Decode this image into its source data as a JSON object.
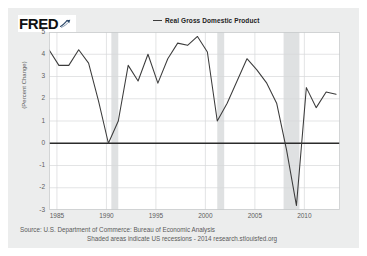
{
  "brand": {
    "name": "FRED",
    "mark_icon": "fred-swoosh-icon"
  },
  "legend": {
    "entries": [
      {
        "label": "Real Gross Domestic Product",
        "color": "#3b3b3b"
      }
    ]
  },
  "footer": {
    "source_line": "Source: U.S. Department of Commerce: Bureau of Economic Analysis",
    "note_line": "Shaded areas indicate US recessions - 2014 research.stlouisfed.org"
  },
  "colors": {
    "card_background": "#eceded",
    "plot_background": "#ffffff",
    "line": "#3b3b3b",
    "zero_line": "#2b2b2b",
    "gridline": "#d7d9da",
    "recession_band": "#dfe1e2",
    "tick_text": "#5d5d5d"
  },
  "chart_data": {
    "type": "line",
    "title": "Real Gross Domestic Product",
    "xlabel": "",
    "ylabel": "(Percent Change)",
    "xlim": [
      1984.2,
      2013.6
    ],
    "ylim": [
      -3,
      5
    ],
    "yticks": [
      5,
      4,
      3,
      2,
      1,
      0,
      -1,
      -2,
      -3
    ],
    "xticks": [
      1985,
      1990,
      1995,
      2000,
      2005,
      2010
    ],
    "grid": true,
    "legend_position": "top-center",
    "zero_line": 0,
    "series": [
      {
        "name": "Real Gross Domestic Product",
        "color": "#3b3b3b",
        "x": [
          1984.2,
          1985.2,
          1986.2,
          1987.2,
          1988.2,
          1989.2,
          1990.2,
          1991.2,
          1992.2,
          1993.2,
          1994.2,
          1995.2,
          1996.2,
          1997.2,
          1998.2,
          1999.2,
          2000.2,
          2001.2,
          2002.2,
          2003.2,
          2004.2,
          2005.2,
          2006.2,
          2007.2,
          2008.2,
          2009.2,
          2010.2,
          2011.2,
          2012.2,
          2013.2
        ],
        "y": [
          4.2,
          3.5,
          3.5,
          4.2,
          3.6,
          1.9,
          0.0,
          1.0,
          3.5,
          2.8,
          4.0,
          2.7,
          3.8,
          4.5,
          4.4,
          4.8,
          4.1,
          1.0,
          1.8,
          2.8,
          3.8,
          3.3,
          2.7,
          1.8,
          -0.3,
          -2.8,
          2.5,
          1.6,
          2.3,
          2.2
        ]
      }
    ],
    "recessions": [
      {
        "label": "1990-1991 recession",
        "start": 1990.5,
        "end": 1991.2
      },
      {
        "label": "2001 recession",
        "start": 2001.2,
        "end": 2001.9
      },
      {
        "label": "2007-2009 recession",
        "start": 2007.9,
        "end": 2009.5
      }
    ]
  }
}
